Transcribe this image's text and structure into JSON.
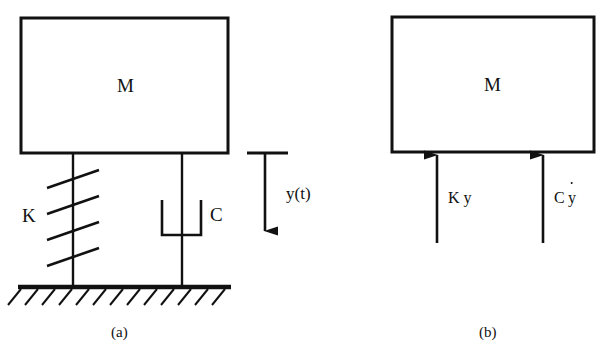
{
  "figure": {
    "type": "free-body-diagram",
    "background_color": "#ffffff",
    "line_color": "#111111"
  },
  "panel_a": {
    "caption": "(a)",
    "mass_label": "M",
    "spring_label": "K",
    "damper_label": "C",
    "displacement_label": "y(t)",
    "mass_block": {
      "x": 21,
      "y": 18,
      "width": 207,
      "height": 135
    },
    "spring": {
      "rod_x": 73,
      "top_y": 153,
      "bottom_y": 287,
      "coil_top": 170,
      "coil_bottom": 248,
      "coil_count": 4,
      "coil_half_width": 26
    },
    "damper": {
      "rod_x": 182,
      "top_y": 153,
      "bottom_y": 287,
      "cup_left": 162,
      "cup_right": 201,
      "cup_top": 200,
      "cup_bottom": 235,
      "piston_y": 222
    },
    "ground": {
      "x1": 18,
      "x2": 231,
      "y": 287,
      "hatch_count": 13,
      "hatch_length": 19
    },
    "displacement_arrow": {
      "x": 265,
      "datum_x1": 247,
      "datum_x2": 288,
      "datum_y": 153,
      "tip_y": 232
    }
  },
  "panel_b": {
    "caption": "(b)",
    "mass_label": "M",
    "spring_force_label": "K y",
    "damper_force_label": "C y",
    "damper_force_has_overdot": true,
    "mass_block": {
      "x": 392,
      "y": 17,
      "width": 202,
      "height": 135
    },
    "spring_force_arrow": {
      "x": 437,
      "tail_y": 243,
      "tip_y": 154
    },
    "damper_force_arrow": {
      "x": 543,
      "tail_y": 243,
      "tip_y": 154
    }
  }
}
